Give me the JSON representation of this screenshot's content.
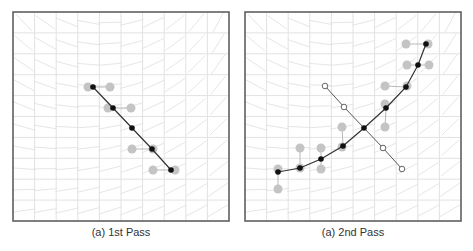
{
  "figure": {
    "width": 473,
    "height": 251,
    "colors": {
      "frame": "#555555",
      "grid": "#e2e2e2",
      "field": "#e6e6e6",
      "curve": "#333333",
      "point": "#111111",
      "candidate": "#c4c4c4",
      "candidate_link": "#b8b8b8",
      "hollow_fill": "#ffffff",
      "hollow_stroke": "#555555",
      "caption": "#333333"
    },
    "grid_cells": 10
  },
  "panels": [
    {
      "id": "first-pass",
      "caption": "(a) 1st Pass",
      "frame": {
        "x": 13,
        "y": 12,
        "w": 216,
        "h": 209
      },
      "caption_center_x": 121,
      "curve": [
        [
          93,
          87
        ],
        [
          113,
          108
        ],
        [
          132,
          128
        ],
        [
          152,
          149
        ],
        [
          171,
          170
        ]
      ],
      "hollow_line": [],
      "candidates": [
        {
          "at": [
            93,
            87
          ],
          "dots": [
            [
              88,
              87
            ],
            [
              110,
              87
            ]
          ]
        },
        {
          "at": [
            113,
            108
          ],
          "dots": [
            [
              108,
              108
            ],
            [
              131,
              108
            ]
          ]
        },
        {
          "at": [
            152,
            149
          ],
          "dots": [
            [
              132,
              149
            ],
            [
              153,
              149
            ]
          ]
        },
        {
          "at": [
            171,
            170
          ],
          "dots": [
            [
              153,
              170
            ],
            [
              175,
              170
            ]
          ]
        }
      ]
    },
    {
      "id": "second-pass",
      "caption": "(a) 2nd Pass",
      "frame": {
        "x": 245,
        "y": 12,
        "w": 216,
        "h": 209
      },
      "caption_center_x": 353,
      "curve": [
        [
          278,
          172
        ],
        [
          300,
          168
        ],
        [
          321,
          159
        ],
        [
          343,
          146
        ],
        [
          364,
          128
        ],
        [
          386,
          108
        ],
        [
          406,
          87
        ],
        [
          418,
          65
        ],
        [
          426,
          44
        ]
      ],
      "hollow_line": [
        [
          325,
          86
        ],
        [
          344,
          107
        ],
        [
          364,
          128
        ],
        [
          383,
          148
        ],
        [
          402,
          169
        ]
      ],
      "candidates": [
        {
          "at": [
            278,
            172
          ],
          "dots": [
            [
              278,
              169
            ],
            [
              278,
              189
            ]
          ]
        },
        {
          "at": [
            300,
            168
          ],
          "dots": [
            [
              300,
              168
            ],
            [
              300,
              148
            ]
          ]
        },
        {
          "at": [
            321,
            159
          ],
          "dots": [
            [
              321,
              148
            ],
            [
              321,
              169
            ]
          ]
        },
        {
          "at": [
            343,
            146
          ],
          "dots": [
            [
              342,
              127
            ],
            [
              342,
              147
            ]
          ]
        },
        {
          "at": [
            386,
            108
          ],
          "dots": [
            [
              385,
              104
            ],
            [
              385,
              127
            ]
          ]
        },
        {
          "at": [
            406,
            87
          ],
          "dots": [
            [
              385,
              86
            ],
            [
              407,
              86
            ]
          ]
        },
        {
          "at": [
            418,
            65
          ],
          "dots": [
            [
              407,
              65
            ],
            [
              429,
              65
            ]
          ]
        },
        {
          "at": [
            426,
            44
          ],
          "dots": [
            [
              406,
              44
            ],
            [
              428,
              44
            ]
          ]
        }
      ]
    }
  ]
}
